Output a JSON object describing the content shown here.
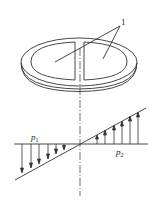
{
  "diagram": {
    "part_label": "1",
    "pressure_left": {
      "symbol": "p",
      "subscript": "1"
    },
    "pressure_right": {
      "symbol": "p",
      "subscript": "2"
    },
    "colors": {
      "line": "#333333",
      "background": "#ffffff"
    }
  }
}
